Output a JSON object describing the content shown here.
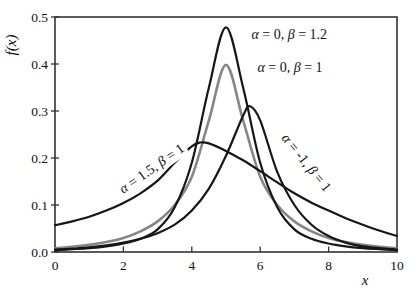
{
  "figure": {
    "background": "#ffffff",
    "frame_color": "#333333",
    "text_color": "#111111"
  },
  "chart_data": {
    "type": "line",
    "title": "",
    "xlabel": "x",
    "ylabel": "f(x)",
    "xlim": [
      0,
      10
    ],
    "ylim": [
      0,
      0.5
    ],
    "x_ticks": [
      0,
      2,
      4,
      6,
      8,
      10
    ],
    "x_tick_labels": [
      "0",
      "2",
      "4",
      "6",
      "8",
      "10"
    ],
    "y_ticks": [
      0.0,
      0.1,
      0.2,
      0.3,
      0.4,
      0.5
    ],
    "y_tick_labels": [
      "0.0",
      "0.1",
      "0.2",
      "0.3",
      "0.4",
      "0.5"
    ],
    "grid": false,
    "legend_position": "inline-annotations",
    "series": [
      {
        "name": "alpha0-beta1",
        "annotation": "α = 0, β = 1",
        "color": "#868686",
        "width": 2.6,
        "x": [
          0,
          0.5,
          1,
          1.5,
          2,
          2.5,
          3,
          3.5,
          4,
          4.5,
          5,
          5.5,
          6,
          6.5,
          7,
          7.5,
          8,
          8.5,
          9,
          9.5,
          10
        ],
        "y": [
          0.008,
          0.011,
          0.015,
          0.021,
          0.03,
          0.044,
          0.065,
          0.1,
          0.16,
          0.28,
          0.398,
          0.28,
          0.16,
          0.1,
          0.065,
          0.044,
          0.03,
          0.021,
          0.015,
          0.011,
          0.008
        ]
      },
      {
        "name": "alpha1.5-beta1",
        "annotation": "α = 1.5, β = 1",
        "color": "#161616",
        "width": 2.2,
        "x": [
          0,
          0.5,
          1,
          1.5,
          2,
          2.5,
          3,
          3.5,
          4,
          4.25,
          4.5,
          5,
          5.5,
          6,
          6.5,
          7,
          7.5,
          8,
          8.5,
          9,
          9.5,
          10
        ],
        "y": [
          0.057,
          0.065,
          0.075,
          0.088,
          0.104,
          0.125,
          0.152,
          0.19,
          0.225,
          0.233,
          0.231,
          0.215,
          0.195,
          0.172,
          0.148,
          0.125,
          0.105,
          0.088,
          0.072,
          0.058,
          0.045,
          0.034
        ]
      },
      {
        "name": "alpha-1-beta1",
        "annotation": "α = -1, β = 1",
        "color": "#161616",
        "width": 2.2,
        "x": [
          0,
          0.5,
          1,
          1.5,
          2,
          2.5,
          3,
          3.5,
          4,
          4.5,
          5,
          5.5,
          5.7,
          6,
          6.5,
          7,
          7.5,
          8,
          8.5,
          9,
          9.5,
          10
        ],
        "y": [
          0.005,
          0.007,
          0.01,
          0.014,
          0.02,
          0.028,
          0.04,
          0.058,
          0.088,
          0.135,
          0.205,
          0.29,
          0.31,
          0.28,
          0.17,
          0.1,
          0.058,
          0.034,
          0.02,
          0.012,
          0.008,
          0.005
        ]
      },
      {
        "name": "alpha0-beta1.2",
        "annotation": "α = 0, β = 1.2",
        "color": "#161616",
        "width": 2.2,
        "x": [
          0,
          0.5,
          1,
          1.5,
          2,
          2.5,
          3,
          3.5,
          4,
          4.5,
          5,
          5.5,
          6,
          6.5,
          7,
          7.5,
          8,
          8.5,
          9,
          9.5,
          10
        ],
        "y": [
          0.004,
          0.006,
          0.008,
          0.012,
          0.018,
          0.028,
          0.048,
          0.095,
          0.19,
          0.35,
          0.478,
          0.35,
          0.19,
          0.095,
          0.048,
          0.028,
          0.018,
          0.012,
          0.008,
          0.006,
          0.004
        ]
      }
    ],
    "annotations": [
      {
        "name": "label-alpha0-beta1.2",
        "text": "α = 0, β = 1.2",
        "x": 6.85,
        "y": 0.462,
        "rotation": 0,
        "masked": false
      },
      {
        "name": "label-alpha0-beta1",
        "text": "α = 0, β = 1",
        "x": 6.87,
        "y": 0.392,
        "rotation": 0,
        "masked": false
      },
      {
        "name": "label-alpha1.5-beta1",
        "text": "α = 1.5, β = 1",
        "x": 2.85,
        "y": 0.176,
        "rotation": -35,
        "masked": true
      },
      {
        "name": "label-alpha-1-beta1",
        "text": "α = -1, β = 1",
        "x": 7.33,
        "y": 0.19,
        "rotation": 51,
        "masked": true
      }
    ]
  }
}
